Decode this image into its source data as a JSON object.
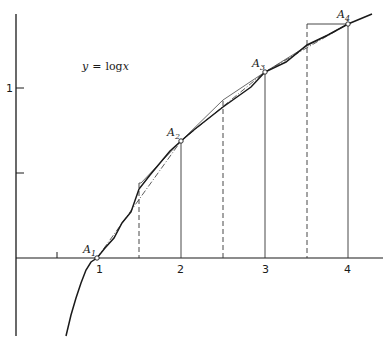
{
  "diagram": {
    "equation_label": "y = log x",
    "equation_parts": {
      "lhs": "y",
      "eq": "=",
      "fn": "log",
      "var": "x"
    },
    "x_axis": {
      "ticks": [
        {
          "value": 0.5,
          "label": ""
        },
        {
          "value": 1,
          "label": "1"
        },
        {
          "value": 2,
          "label": "2"
        },
        {
          "value": 3,
          "label": "3"
        },
        {
          "value": 4,
          "label": "4"
        }
      ]
    },
    "y_axis": {
      "ticks": [
        {
          "value": 0.5,
          "label": ""
        },
        {
          "value": 1,
          "label": "1"
        }
      ]
    },
    "points": [
      {
        "name": "A",
        "sub": "1",
        "x": 1
      },
      {
        "name": "A",
        "sub": "2",
        "x": 2
      },
      {
        "name": "A",
        "sub": "3",
        "x": 3
      },
      {
        "name": "A",
        "sub": "4",
        "x": 4
      }
    ],
    "dashed_verticals_at": [
      1.5,
      2.5,
      3.5
    ],
    "solid_verticals_at": [
      2,
      3,
      4
    ],
    "colors": {
      "ink": "#1a1a1a",
      "background": "#ffffff"
    }
  }
}
